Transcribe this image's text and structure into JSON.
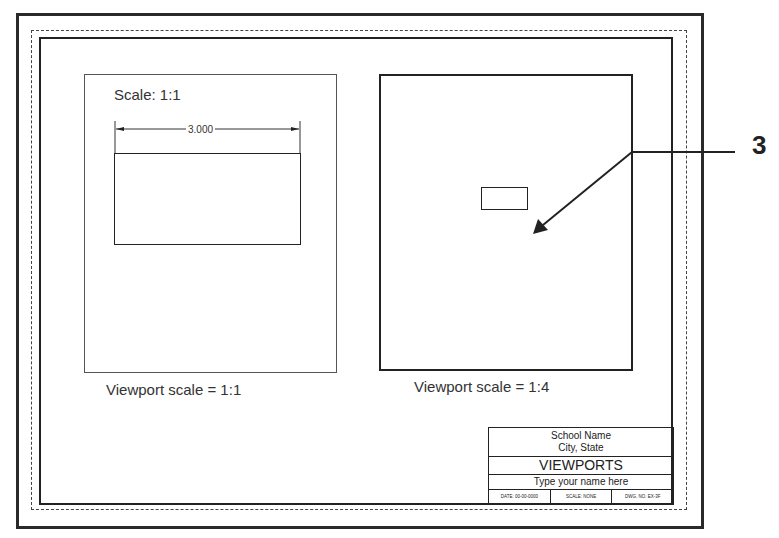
{
  "drawing": {
    "left_viewport": {
      "scale_note": "Scale: 1:1",
      "dimension": "3.000",
      "caption": "Viewport scale = 1:1"
    },
    "right_viewport": {
      "caption": "Viewport scale = 1:4"
    },
    "callout": "3"
  },
  "title_block": {
    "school": "School Name",
    "city": "City, State",
    "title": "VIEWPORTS",
    "name": "Type your name here",
    "footer": [
      "DATE: 00-00-0000",
      "SCALE: NONE",
      "DWG. NO. EX-3F"
    ]
  }
}
